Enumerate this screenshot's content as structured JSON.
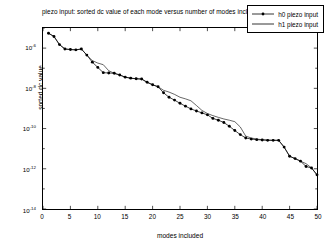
{
  "chart_data": {
    "type": "line",
    "title": "piezo input:  sorted dc value of each mode versus number of modes included",
    "xlabel": "modes included",
    "ylabel": "sorted dc value",
    "xlim": [
      0,
      50
    ],
    "ylim": [
      1e-14,
      1e-05
    ],
    "yscale": "log",
    "grid": false,
    "legend_position": "top-right",
    "xticks": [
      0,
      5,
      10,
      15,
      20,
      25,
      30,
      35,
      40,
      45,
      50
    ],
    "xtick_labels": [
      "0",
      "5",
      "10",
      "15",
      "20",
      "25",
      "30",
      "35",
      "40",
      "45",
      "50"
    ],
    "yticks": [
      1e-06,
      1e-08,
      1e-10,
      1e-12,
      1e-14
    ],
    "ytick_labels": [
      "10-6",
      "10-8",
      "10-10",
      "10-12",
      "10-14"
    ],
    "ytick_mantissa": "10",
    "ytick_exponents": [
      "-6",
      "-8",
      "-10",
      "-12",
      "-14"
    ],
    "series": [
      {
        "name": "h0 piezo input",
        "marker": "dot",
        "linestyle": "solid",
        "color": "#000000",
        "x": [
          1,
          2,
          3,
          4,
          5,
          6,
          7,
          8,
          9,
          10,
          11,
          12,
          13,
          14,
          15,
          16,
          17,
          18,
          19,
          20,
          21,
          22,
          23,
          24,
          25,
          26,
          27,
          28,
          29,
          30,
          31,
          32,
          33,
          34,
          35,
          36,
          37,
          38,
          39,
          40,
          41,
          42,
          43,
          44,
          45,
          46,
          47,
          48,
          49,
          50
        ],
        "y": [
          5.5e-06,
          3.8e-06,
          1.5e-06,
          9e-07,
          8.5e-07,
          8.2e-07,
          9e-07,
          4.5e-07,
          2e-07,
          1.1e-07,
          6e-08,
          5.8e-08,
          5.6e-08,
          4.6e-08,
          3.6e-08,
          3.2e-08,
          3e-08,
          2.9e-08,
          2e-08,
          1.5e-08,
          1.2e-08,
          6e-09,
          3.6e-09,
          2.6e-09,
          1.8e-09,
          1.3e-09,
          9.5e-10,
          7.5e-10,
          6e-10,
          4.8e-10,
          3.2e-10,
          2.6e-10,
          2e-10,
          1.3e-10,
          8e-11,
          5e-11,
          3.4e-11,
          3e-11,
          2.8e-11,
          2.7e-11,
          2.6e-11,
          2.6e-11,
          2.6e-11,
          1.2e-11,
          4.2e-12,
          3.2e-12,
          2.4e-12,
          1.3e-12,
          1.1e-12,
          5e-13
        ]
      },
      {
        "name": "h1 piezo input",
        "marker": "none",
        "linestyle": "solid",
        "color": "#000000",
        "x": [
          1,
          2,
          3,
          4,
          5,
          6,
          7,
          8,
          9,
          10,
          11,
          12,
          13,
          14,
          15,
          16,
          17,
          18,
          19,
          20,
          21,
          22,
          23,
          24,
          25,
          26,
          27,
          28,
          29,
          30,
          31,
          32,
          33,
          34,
          35,
          36,
          37,
          38,
          39,
          40,
          41,
          42,
          43,
          44,
          45,
          46,
          47,
          48,
          49,
          50
        ],
        "y": [
          5.5e-06,
          3.8e-06,
          1.5e-06,
          9e-07,
          8.5e-07,
          8.2e-07,
          9e-07,
          4.5e-07,
          2.4e-07,
          1.8e-07,
          1.5e-07,
          7.5e-08,
          5.6e-08,
          4.6e-08,
          3.6e-08,
          3.2e-08,
          3e-08,
          2.9e-08,
          2e-08,
          1.5e-08,
          1.2e-08,
          8e-09,
          6.5e-09,
          5e-09,
          3.6e-09,
          3e-09,
          2.4e-09,
          1.4e-09,
          8e-10,
          5.6e-10,
          4.4e-10,
          3.6e-10,
          3e-10,
          2.6e-10,
          2.2e-10,
          1.2e-10,
          4.2e-11,
          3.4e-11,
          3e-11,
          2.8e-11,
          2.7e-11,
          2.6e-11,
          2.6e-11,
          1.2e-11,
          4.2e-12,
          3.2e-12,
          2.4e-12,
          1.8e-12,
          1.1e-12,
          5e-13
        ]
      }
    ]
  },
  "legend": {
    "entries": [
      {
        "label": "h0 piezo input"
      },
      {
        "label": "h1 piezo input"
      }
    ]
  }
}
